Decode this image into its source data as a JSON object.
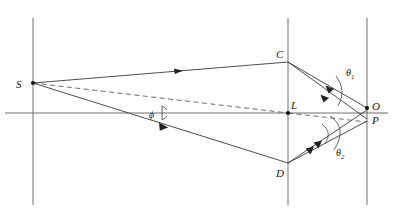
{
  "figure": {
    "type": "optical-ray-diagram",
    "background_color": "#ffffff",
    "line_color": "#3a3a3a",
    "dashed_color": "#5a5a5a",
    "label_color": "#1a1a1a"
  },
  "labels": {
    "source": "S",
    "top_edge": "C",
    "lens_center": "L",
    "bottom_edge": "D",
    "image_point": "O",
    "secondary_point": "P",
    "angle_phi": "ϕ",
    "angle_theta1": "θ",
    "angle_theta1_sub": "1",
    "angle_theta2": "θ",
    "angle_theta2_sub": "2"
  },
  "geometry": {
    "left_plane_x": 33,
    "lens_plane_x": 288,
    "right_plane_x": 367,
    "axis_y": 113,
    "source": {
      "x": 33,
      "y": 83
    },
    "point_c": {
      "x": 288,
      "y": 62
    },
    "point_l": {
      "x": 288,
      "y": 113
    },
    "point_d": {
      "x": 288,
      "y": 163
    },
    "point_o": {
      "x": 367,
      "y": 108
    },
    "point_p": {
      "x": 367,
      "y": 122
    }
  },
  "label_positions": {
    "S": {
      "x": 18,
      "y": 88
    },
    "C": {
      "x": 277,
      "y": 58
    },
    "L": {
      "x": 292,
      "y": 109
    },
    "D": {
      "x": 277,
      "y": 176
    },
    "O": {
      "x": 373,
      "y": 109
    },
    "P": {
      "x": 373,
      "y": 123
    },
    "phi": {
      "x": 150,
      "y": 118
    },
    "theta1": {
      "x": 345,
      "y": 76
    },
    "theta2": {
      "x": 336,
      "y": 156
    }
  }
}
